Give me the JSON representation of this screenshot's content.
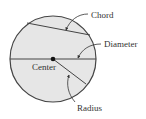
{
  "diagram": {
    "colors": {
      "fill": "#e6e6e6",
      "stroke": "#444444",
      "text": "#333333",
      "background": "#ffffff"
    },
    "circle": {
      "cx": 53,
      "cy": 59,
      "r": 43
    },
    "labels": {
      "chord": "Chord",
      "diameter": "Diameter",
      "center": "Center",
      "radius": "Radius"
    }
  }
}
